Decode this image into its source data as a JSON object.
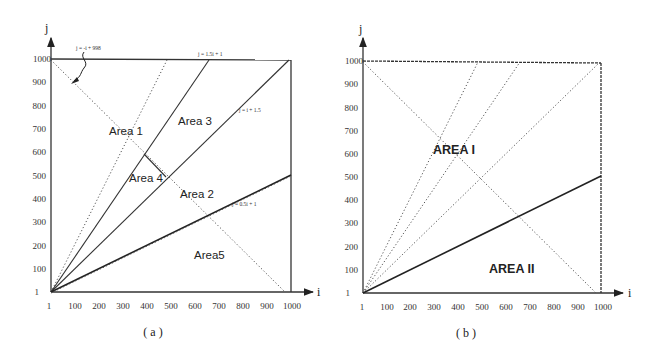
{
  "figure": {
    "panels": [
      {
        "id": "a",
        "caption": "( a )",
        "x_axis_label": "i",
        "y_axis_label": "j",
        "x_ticks": [
          "1",
          "100",
          "200",
          "300",
          "400",
          "500",
          "600",
          "700",
          "800",
          "900",
          "1000"
        ],
        "y_ticks": [
          "1",
          "100",
          "200",
          "300",
          "400",
          "500",
          "600",
          "700",
          "800",
          "900",
          "1000"
        ],
        "equations": {
          "anti_diagonal": "j = -i + 998",
          "steep": "j = 1.5i + 1",
          "diagonal": "j = i + 1.5",
          "shallow": "j = 0.5i + 1"
        },
        "areas": [
          "Area 1",
          "Area 2",
          "Area 3",
          "Area 4",
          "Area5"
        ]
      },
      {
        "id": "b",
        "caption": "( b )",
        "x_axis_label": "i",
        "y_axis_label": "j",
        "x_ticks": [
          "1",
          "100",
          "200",
          "300",
          "400",
          "500",
          "600",
          "700",
          "800",
          "900",
          "1000"
        ],
        "y_ticks": [
          "1",
          "100",
          "200",
          "300",
          "400",
          "500",
          "600",
          "700",
          "800",
          "900",
          "1000"
        ],
        "areas": [
          "AREA I",
          "AREA II"
        ]
      }
    ]
  }
}
